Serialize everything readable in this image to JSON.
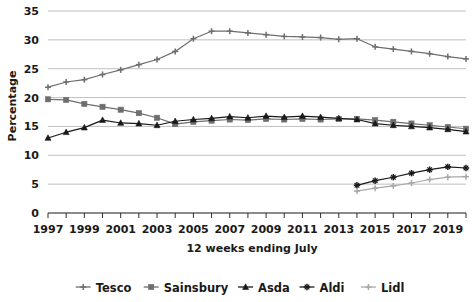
{
  "chart_data": {
    "type": "line",
    "title": "",
    "xlabel": "12 weeks ending July",
    "ylabel": "Percentage",
    "ylim": [
      0,
      35
    ],
    "ytick_step": 5,
    "yticks": [
      "0",
      "5",
      "10",
      "15",
      "20",
      "25",
      "30",
      "35"
    ],
    "xlim": [
      1997,
      2020
    ],
    "xticks": [
      "1997",
      "1999",
      "2001",
      "2003",
      "2005",
      "2007",
      "2009",
      "2011",
      "2013",
      "2015",
      "2017",
      "2019"
    ],
    "xtick_step": 2,
    "x": [
      1997,
      1998,
      1999,
      2000,
      2001,
      2002,
      2003,
      2004,
      2005,
      2006,
      2007,
      2008,
      2009,
      2010,
      2011,
      2012,
      2013,
      2014,
      2015,
      2016,
      2017,
      2018,
      2019,
      2020
    ],
    "grid": "horizontal",
    "legend_position": "bottom",
    "series": [
      {
        "name": "Tesco",
        "color": "#6e6e6e",
        "marker": "plus",
        "values": [
          21.8,
          22.7,
          23.1,
          24.0,
          24.8,
          25.7,
          26.6,
          28.0,
          30.2,
          31.5,
          31.5,
          31.2,
          30.9,
          30.6,
          30.5,
          30.4,
          30.1,
          30.2,
          28.8,
          28.4,
          28.0,
          27.6,
          27.1,
          26.7
        ]
      },
      {
        "name": "Sainsbury",
        "color": "#6e6e6e",
        "marker": "square",
        "values": [
          19.7,
          19.6,
          18.9,
          18.4,
          17.9,
          17.3,
          16.5,
          15.4,
          15.8,
          16.0,
          16.2,
          16.1,
          16.3,
          16.2,
          16.3,
          16.2,
          16.3,
          16.3,
          16.1,
          15.8,
          15.5,
          15.2,
          14.9,
          14.6
        ]
      },
      {
        "name": "Asda",
        "color": "#1a1a1a",
        "marker": "triangle",
        "values": [
          13.0,
          14.0,
          14.8,
          16.1,
          15.6,
          15.5,
          15.2,
          15.9,
          16.2,
          16.4,
          16.7,
          16.5,
          16.8,
          16.6,
          16.8,
          16.6,
          16.4,
          16.2,
          15.5,
          15.2,
          15.0,
          14.8,
          14.5,
          14.1
        ]
      },
      {
        "name": "Aldi",
        "color": "#1a1a1a",
        "marker": "star",
        "values": [
          null,
          null,
          null,
          null,
          null,
          null,
          null,
          null,
          null,
          null,
          null,
          null,
          null,
          null,
          null,
          null,
          null,
          4.8,
          5.6,
          6.2,
          6.9,
          7.5,
          8.0,
          7.8
        ]
      },
      {
        "name": "Lidl",
        "color": "#a8a8a8",
        "marker": "plus",
        "values": [
          null,
          null,
          null,
          null,
          null,
          null,
          null,
          null,
          null,
          null,
          null,
          null,
          null,
          null,
          null,
          null,
          null,
          3.8,
          4.3,
          4.7,
          5.2,
          5.8,
          6.2,
          6.3
        ]
      }
    ]
  }
}
